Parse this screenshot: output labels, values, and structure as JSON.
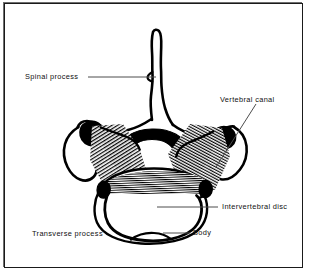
{
  "figure": {
    "kind": "anatomical-line-drawing",
    "background_color": "#ffffff",
    "ink_color": "#000000",
    "frame_color": "#1a1a1a",
    "leader_color": "#555555"
  },
  "labels": {
    "spinal_process": "Spinal process",
    "vertebral_canal": "Vertebral canal",
    "intervertebral_disc": "Intervertebral disc",
    "transverse_process": "Transverse process",
    "body": "Body"
  }
}
